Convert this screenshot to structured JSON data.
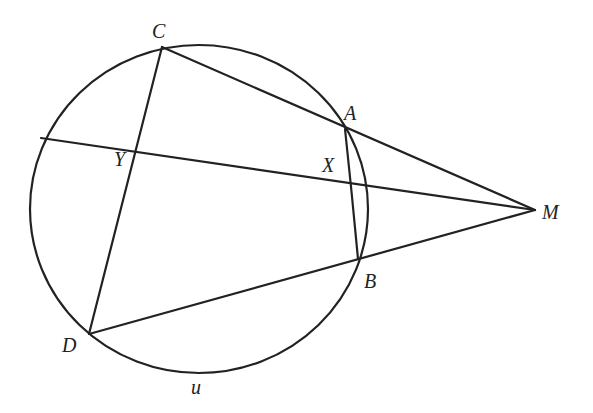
{
  "diagram": {
    "type": "geometry",
    "circle": {
      "label": "u",
      "cx": 199,
      "cy": 209,
      "rx": 169,
      "ry": 164
    },
    "points": {
      "C": {
        "x": 162,
        "y": 47
      },
      "A": {
        "x": 345,
        "y": 129
      },
      "B": {
        "x": 358,
        "y": 259
      },
      "D": {
        "x": 89,
        "y": 334
      },
      "M": {
        "x": 535,
        "y": 210
      },
      "P": {
        "x": 41,
        "y": 138
      },
      "Y": {
        "x": 137,
        "y": 149
      },
      "X": {
        "x": 366,
        "y": 184
      }
    },
    "segments": [
      {
        "from": "C",
        "to": "M"
      },
      {
        "from": "D",
        "to": "M"
      },
      {
        "from": "P",
        "to": "M"
      },
      {
        "from": "C",
        "to": "D"
      },
      {
        "from": "A",
        "to": "B"
      }
    ],
    "labels": {
      "C": "C",
      "A": "A",
      "Y": "Y",
      "X": "X",
      "M": "M",
      "B": "B",
      "D": "D",
      "u": "u"
    }
  }
}
